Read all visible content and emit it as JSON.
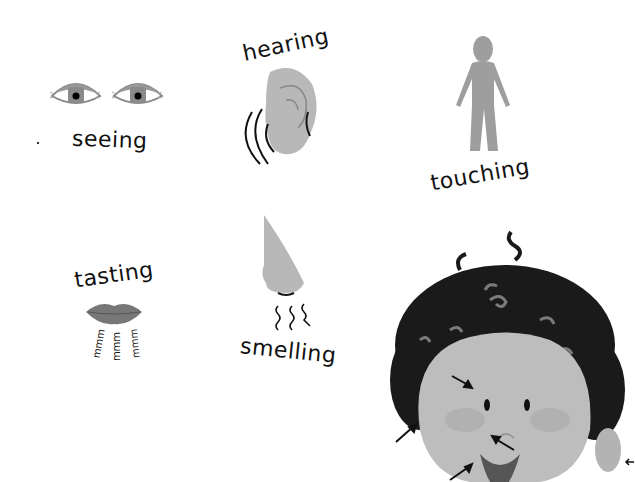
{
  "senses": [
    {
      "id": "seeing",
      "label": "seeing",
      "icon": "eyes-icon"
    },
    {
      "id": "hearing",
      "label": "hearing",
      "icon": "ear-icon"
    },
    {
      "id": "touching",
      "label": "touching",
      "icon": "person-icon"
    },
    {
      "id": "tasting",
      "label": "tasting",
      "icon": "lips-icon",
      "sound_text": "mmm"
    },
    {
      "id": "smelling",
      "label": "smelling",
      "icon": "nose-icon"
    }
  ],
  "face_illustration": {
    "description": "curly-haired child face with arrows pointing to eyes, ears, nose and mouth"
  },
  "colors": {
    "skin": "#bdbdbd",
    "hair": "#1a1a1a",
    "hair_curl": "#7a7a7a",
    "lips": "#777777",
    "ink": "#111111"
  }
}
